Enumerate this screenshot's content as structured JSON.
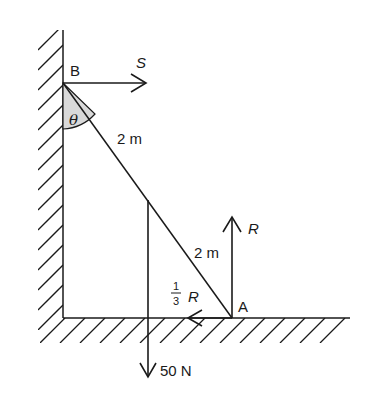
{
  "diagram": {
    "points": {
      "top": "B",
      "bottom": "A"
    },
    "angle_label": "θ",
    "segment_upper_length": "2 m",
    "segment_lower_length": "2 m",
    "forces": {
      "wall_reaction": "S",
      "normal_reaction": "R",
      "friction_num": "1",
      "friction_den": "3",
      "friction_symbol": "R",
      "weight": "50 N"
    },
    "colors": {
      "line": "#1a1a1a",
      "angle_fill": "#d9d9d9"
    }
  }
}
